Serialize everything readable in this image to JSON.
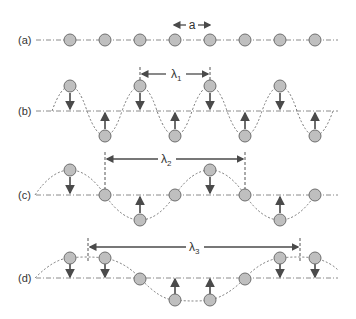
{
  "diagram": {
    "type": "phonon-lattice-waves",
    "colors": {
      "atom_fill": "#bfbfbf",
      "atom_stroke": "#6e6e6e",
      "axis": "#8a8a8a",
      "wave": "#777777",
      "arrow": "#4a4a4a",
      "text": "#333333"
    },
    "spacing_label": "a",
    "rows": [
      {
        "label": "(a)",
        "wavelength_label": "",
        "wavelength_sub": ""
      },
      {
        "label": "(b)",
        "wavelength_label": "λ",
        "wavelength_sub": "1"
      },
      {
        "label": "(c)",
        "wavelength_label": "λ",
        "wavelength_sub": "2"
      },
      {
        "label": "(d)",
        "wavelength_label": "λ",
        "wavelength_sub": "3"
      }
    ]
  }
}
